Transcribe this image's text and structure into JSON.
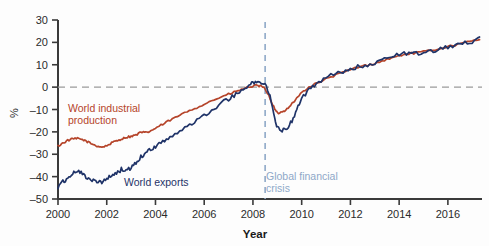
{
  "chart_data": {
    "type": "line",
    "title": "",
    "subtitle": "",
    "xlabel": "Year",
    "ylabel": "%",
    "xlim": [
      2000.0,
      2017.4
    ],
    "ylim": [
      -50,
      30
    ],
    "xticks": [
      2000,
      2002,
      2004,
      2006,
      2008,
      2010,
      2012,
      2014,
      2016
    ],
    "xtick_labels": [
      "2000",
      "2002",
      "2004",
      "2006",
      "2008",
      "2010",
      "2012",
      "2014",
      "2016"
    ],
    "yticks": [
      30,
      20,
      10,
      0,
      -10,
      -20,
      -30,
      -40,
      -50
    ],
    "ytick_labels": [
      "30",
      "20",
      "10",
      "0",
      "-10",
      "-20",
      "-30",
      "-40",
      "-50"
    ],
    "grid": false,
    "zero_reference_line": {
      "value": 0,
      "style": "dashed",
      "color": "#9a9a9a"
    },
    "legend_position": "inline-annotations",
    "annotations": [
      {
        "name": "global-financial-crisis",
        "text_line_1": "Global financial",
        "text_line_2": "crisis",
        "x": 2008.5,
        "color": "#8ea8c8",
        "line_style": "dashed"
      }
    ],
    "series": [
      {
        "name": "World industrial production",
        "color": "#b5442a",
        "label_line_1": "World industrial",
        "label_line_2": "production",
        "x": [
          2000.0,
          2000.2,
          2000.4,
          2000.6,
          2000.8,
          2001.0,
          2001.2,
          2001.4,
          2001.6,
          2001.8,
          2002.0,
          2002.2,
          2002.4,
          2002.6,
          2002.8,
          2003.0,
          2003.2,
          2003.4,
          2003.6,
          2003.8,
          2004.0,
          2004.3,
          2004.6,
          2005.0,
          2005.4,
          2005.8,
          2006.2,
          2006.6,
          2007.0,
          2007.3,
          2007.6,
          2007.9,
          2008.1,
          2008.3,
          2008.5,
          2008.7,
          2008.9,
          2009.0,
          2009.2,
          2009.4,
          2009.6,
          2009.8,
          2010.0,
          2010.3,
          2010.6,
          2011.0,
          2011.4,
          2011.8,
          2012.2,
          2012.6,
          2013.0,
          2013.4,
          2013.8,
          2014.2,
          2014.6,
          2015.0,
          2015.4,
          2015.8,
          2016.2,
          2016.6,
          2017.0,
          2017.3
        ],
        "values": [
          -26.4,
          -25.0,
          -23.8,
          -23.2,
          -23.0,
          -23.4,
          -24.4,
          -25.4,
          -26.3,
          -26.8,
          -26.2,
          -25.0,
          -24.0,
          -23.2,
          -22.4,
          -22.0,
          -21.4,
          -20.2,
          -20.4,
          -19.6,
          -18.4,
          -16.6,
          -14.8,
          -12.6,
          -10.4,
          -8.6,
          -6.6,
          -4.8,
          -3.2,
          -2.0,
          -0.8,
          0.2,
          0.6,
          0.4,
          -0.6,
          -5.0,
          -10.0,
          -11.6,
          -11.2,
          -9.6,
          -7.4,
          -5.0,
          -2.4,
          0.0,
          1.6,
          3.6,
          5.4,
          7.0,
          8.6,
          9.6,
          10.6,
          12.0,
          13.4,
          14.6,
          15.2,
          15.8,
          16.6,
          17.6,
          18.6,
          19.6,
          20.6,
          21.2
        ]
      },
      {
        "name": "World exports",
        "color": "#1f3368",
        "label": "World exports",
        "x": [
          2000.0,
          2000.2,
          2000.4,
          2000.6,
          2000.8,
          2001.0,
          2001.2,
          2001.4,
          2001.6,
          2001.8,
          2002.0,
          2002.2,
          2002.4,
          2002.6,
          2002.8,
          2003.0,
          2003.2,
          2003.4,
          2003.6,
          2003.8,
          2004.0,
          2004.3,
          2004.6,
          2005.0,
          2005.4,
          2005.8,
          2006.2,
          2006.6,
          2007.0,
          2007.3,
          2007.6,
          2007.9,
          2008.1,
          2008.3,
          2008.5,
          2008.7,
          2008.9,
          2009.0,
          2009.2,
          2009.4,
          2009.6,
          2009.8,
          2010.0,
          2010.3,
          2010.6,
          2011.0,
          2011.4,
          2011.8,
          2012.2,
          2012.6,
          2013.0,
          2013.4,
          2013.8,
          2014.2,
          2014.6,
          2015.0,
          2015.4,
          2015.8,
          2016.2,
          2016.6,
          2017.0,
          2017.3
        ],
        "values": [
          -45.0,
          -42.4,
          -40.8,
          -38.6,
          -37.4,
          -38.6,
          -40.6,
          -41.4,
          -42.0,
          -42.8,
          -41.2,
          -39.6,
          -38.4,
          -36.8,
          -37.4,
          -36.0,
          -33.6,
          -31.0,
          -29.6,
          -28.0,
          -26.4,
          -24.2,
          -22.4,
          -19.8,
          -17.0,
          -14.2,
          -11.0,
          -8.0,
          -5.2,
          -3.4,
          -1.4,
          1.4,
          2.4,
          1.6,
          1.8,
          -4.4,
          -14.0,
          -18.0,
          -19.2,
          -18.2,
          -15.2,
          -10.4,
          -5.2,
          -1.2,
          1.8,
          4.4,
          6.0,
          7.2,
          8.8,
          9.8,
          11.0,
          12.4,
          13.8,
          15.2,
          15.0,
          14.8,
          16.2,
          17.4,
          18.6,
          19.4,
          20.4,
          22.4
        ]
      }
    ]
  },
  "accessibility": {
    "chart_description": "Line chart comparing world industrial production and world exports indices from 2000 to 2017, both rising steadily with a sharp drop at the 2008 global financial crisis."
  }
}
